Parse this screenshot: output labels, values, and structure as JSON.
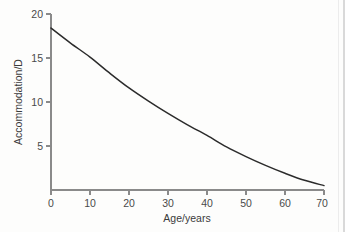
{
  "figure": {
    "background_color": "#fdfdfc",
    "curve_color": "#2b2b2b",
    "axis_color": "#8a8a8a",
    "text_color": "#3b3b3b"
  },
  "chart_data": {
    "type": "line",
    "title": "",
    "subtitle": "",
    "xlabel": "Age/years",
    "ylabel": "Accommodation/D",
    "xlim": [
      0,
      70
    ],
    "ylim": [
      0,
      20
    ],
    "xticks": [
      0,
      10,
      20,
      30,
      40,
      50,
      60,
      70
    ],
    "xtick_labels": [
      "0",
      "10",
      "20",
      "30",
      "40",
      "50",
      "60",
      "70"
    ],
    "yticks": [
      5,
      10,
      15,
      20
    ],
    "ytick_labels": [
      "5",
      "10",
      "15",
      "20"
    ],
    "grid": false,
    "legend": null,
    "legend_position": "none",
    "annotations": [],
    "series": [
      {
        "name": "Accommodation amplitude",
        "x": [
          0,
          5,
          10,
          15,
          20,
          25,
          30,
          35,
          40,
          45,
          50,
          55,
          60,
          65,
          70
        ],
        "values": [
          18.4,
          16.7,
          15.1,
          13.3,
          11.6,
          10.1,
          8.7,
          7.4,
          6.2,
          4.9,
          3.8,
          2.8,
          1.9,
          1.1,
          0.5
        ]
      }
    ]
  }
}
